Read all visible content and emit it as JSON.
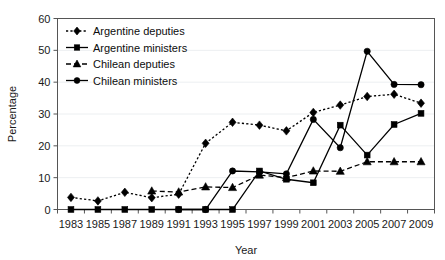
{
  "chart_data": {
    "type": "line",
    "title": "",
    "xlabel": "Year",
    "ylabel": "Percentage",
    "xlim": [
      1983,
      2009
    ],
    "ylim": [
      0,
      60
    ],
    "ytick_step": 10,
    "grid": true,
    "legend_position": "top-left",
    "x": [
      1983,
      1985,
      1987,
      1989,
      1991,
      1993,
      1995,
      1997,
      1999,
      2001,
      2003,
      2005,
      2007,
      2009
    ],
    "xtick_labels": [
      "1983",
      "1985",
      "1987",
      "1989",
      "1991",
      "1993",
      "1995",
      "1997",
      "1999",
      "2001",
      "2003",
      "2005",
      "2007",
      "2009"
    ],
    "ytick_labels": [
      "0",
      "10",
      "20",
      "30",
      "40",
      "50",
      "60"
    ],
    "ytick_values": [
      0,
      10,
      20,
      30,
      40,
      50,
      60
    ],
    "series": [
      {
        "name": "Argentine deputies",
        "marker": "diamond",
        "linestyle": "dotted",
        "values": [
          3.8,
          2.7,
          5.4,
          3.7,
          4.8,
          20.8,
          27.4,
          26.5,
          24.7,
          30.5,
          32.8,
          35.5,
          36.2,
          33.4
        ]
      },
      {
        "name": "Argentine ministers",
        "marker": "square",
        "linestyle": "solid",
        "values": [
          0,
          0,
          0,
          0,
          0,
          0,
          0,
          12.1,
          9.5,
          8.4,
          26.5,
          17.1,
          26.7,
          30.2
        ]
      },
      {
        "name": "Chilean deputies",
        "marker": "triangle",
        "linestyle": "dashed",
        "values": [
          null,
          null,
          null,
          5.8,
          5.5,
          7.1,
          6.9,
          10.8,
          10.0,
          12.1,
          12.0,
          15.0,
          15.0,
          15.0
        ]
      },
      {
        "name": "Chilean ministers",
        "marker": "circle",
        "linestyle": "solid",
        "values": [
          null,
          null,
          null,
          null,
          0,
          0,
          12.1,
          11.8,
          11.2,
          28.3,
          19.4,
          49.7,
          39.3,
          39.2
        ]
      }
    ],
    "legend_entries": [
      {
        "label": "Argentine deputies",
        "marker": "diamond",
        "linestyle": "dotted"
      },
      {
        "label": "Argentine ministers",
        "marker": "square",
        "linestyle": "solid"
      },
      {
        "label": "Chilean deputies",
        "marker": "triangle",
        "linestyle": "dashed"
      },
      {
        "label": "Chilean ministers",
        "marker": "circle",
        "linestyle": "solid"
      }
    ],
    "colors": {
      "series": "#000000",
      "grid": "#eceff1",
      "axis": "#555555",
      "text": "#1a1a1a",
      "background": "#ffffff"
    }
  }
}
